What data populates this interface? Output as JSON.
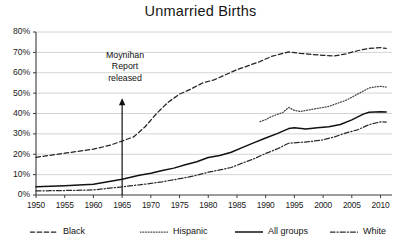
{
  "chart_data": {
    "type": "line",
    "title": "Unmarried Births",
    "xlabel": "",
    "ylabel": "",
    "xlim": [
      1950,
      2012
    ],
    "ylim": [
      0,
      80
    ],
    "grid": true,
    "y_ticks": [
      "0%",
      "10%",
      "20%",
      "30%",
      "40%",
      "50%",
      "60%",
      "70%",
      "80%"
    ],
    "y_tick_values": [
      0,
      10,
      20,
      30,
      40,
      50,
      60,
      70,
      80
    ],
    "x_ticks": [
      "1950",
      "1955",
      "1960",
      "1965",
      "1970",
      "1975",
      "1980",
      "1985",
      "1990",
      "1995",
      "2000",
      "2005",
      "2010"
    ],
    "x_tick_values": [
      1950,
      1955,
      1960,
      1965,
      1970,
      1975,
      1980,
      1985,
      1990,
      1995,
      2000,
      2005,
      2010
    ],
    "legend_position": "bottom",
    "annotations": [
      {
        "text": "Moynihan Report released",
        "line1": "Moynihan",
        "line2": "Report",
        "line3": "released",
        "x": 1965,
        "arrow": "up",
        "arrow_from": 0,
        "arrow_to": 47
      }
    ],
    "series": [
      {
        "name": "Black",
        "style": "dashed",
        "color": "#222222",
        "x": [
          1950,
          1955,
          1960,
          1963,
          1965,
          1967,
          1969,
          1971,
          1973,
          1975,
          1977,
          1979,
          1981,
          1983,
          1985,
          1987,
          1989,
          1991,
          1993,
          1994,
          1996,
          1998,
          2000,
          2002,
          2004,
          2006,
          2008,
          2010,
          2011
        ],
        "values": [
          18.5,
          20.5,
          22.5,
          24.5,
          26.5,
          28.5,
          33.5,
          40.0,
          45.5,
          49.5,
          52.0,
          55.0,
          56.5,
          59.0,
          61.5,
          63.5,
          65.5,
          68.0,
          69.5,
          70.2,
          69.5,
          69.0,
          68.5,
          68.3,
          69.3,
          70.8,
          72.0,
          72.3,
          72.0
        ]
      },
      {
        "name": "Hispanic",
        "style": "dotted",
        "color": "#4a4a4a",
        "x": [
          1989,
          1990,
          1991,
          1992,
          1993,
          1994,
          1995,
          1996,
          1997,
          1998,
          1999,
          2000,
          2001,
          2002,
          2003,
          2004,
          2005,
          2006,
          2007,
          2008,
          2009,
          2010,
          2011
        ],
        "values": [
          36.0,
          37.0,
          38.5,
          39.5,
          40.5,
          43.0,
          41.5,
          41.0,
          41.5,
          42.0,
          42.5,
          43.0,
          43.5,
          44.5,
          45.5,
          46.5,
          48.0,
          49.5,
          51.0,
          52.5,
          53.0,
          53.3,
          53.0
        ]
      },
      {
        "name": "All groups",
        "style": "solid",
        "color": "#111111",
        "x": [
          1950,
          1955,
          1960,
          1965,
          1968,
          1970,
          1972,
          1974,
          1976,
          1978,
          1980,
          1982,
          1984,
          1986,
          1988,
          1990,
          1992,
          1994,
          1995,
          1997,
          1999,
          2001,
          2003,
          2005,
          2007,
          2008,
          2010,
          2011
        ],
        "values": [
          4.0,
          4.5,
          5.3,
          7.7,
          9.7,
          10.7,
          12.0,
          13.2,
          14.8,
          16.3,
          18.4,
          19.4,
          21.0,
          23.4,
          25.7,
          28.0,
          30.1,
          32.6,
          33.0,
          32.4,
          33.0,
          33.5,
          34.6,
          36.9,
          39.7,
          40.6,
          40.8,
          40.7
        ]
      },
      {
        "name": "White",
        "style": "dashdot",
        "color": "#2b2b2b",
        "x": [
          1950,
          1955,
          1960,
          1965,
          1968,
          1970,
          1972,
          1974,
          1976,
          1978,
          1980,
          1982,
          1984,
          1986,
          1988,
          1990,
          1992,
          1994,
          1996,
          1998,
          2000,
          2002,
          2004,
          2006,
          2008,
          2010,
          2011
        ],
        "values": [
          2.0,
          2.2,
          2.5,
          4.0,
          5.0,
          5.7,
          6.5,
          7.5,
          8.5,
          9.7,
          11.2,
          12.3,
          13.5,
          15.7,
          17.8,
          20.4,
          22.6,
          25.4,
          25.8,
          26.3,
          27.1,
          28.5,
          30.5,
          32.0,
          34.5,
          35.9,
          35.8
        ]
      }
    ]
  },
  "legend": {
    "items": [
      {
        "label": "Black",
        "style": "dashed"
      },
      {
        "label": "Hispanic",
        "style": "dotted"
      },
      {
        "label": "All groups",
        "style": "solid"
      },
      {
        "label": "White",
        "style": "dashdot"
      }
    ]
  }
}
